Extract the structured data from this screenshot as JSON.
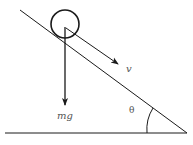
{
  "diagram": {
    "labels": {
      "velocity": "v",
      "weight": "mg",
      "angle": "θ"
    },
    "colors": {
      "stroke": "#1a1a1a",
      "label": "#555555",
      "background": "#ffffff"
    },
    "geometry": {
      "incline": {
        "x1": 20,
        "y1": 10,
        "x2": 187,
        "y2": 133
      },
      "ground": {
        "x1": 5,
        "y1": 133,
        "x2": 187,
        "y2": 133
      },
      "ball": {
        "cx": 65,
        "cy": 24,
        "r": 14
      },
      "weight_arrow": {
        "x1": 65,
        "y1": 27,
        "x2": 65,
        "y2": 105
      },
      "velocity_arrow": {
        "x1": 68,
        "y1": 29,
        "x2": 118,
        "y2": 64
      }
    }
  }
}
